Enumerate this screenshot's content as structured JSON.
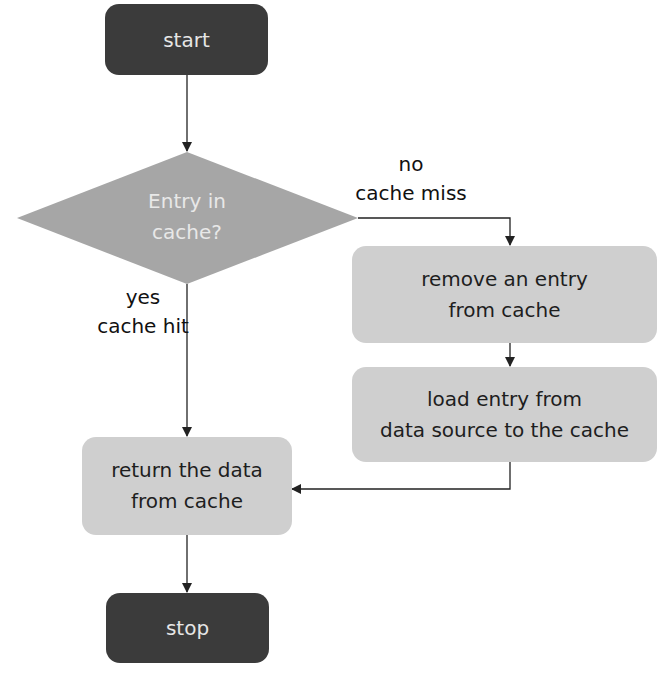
{
  "diagram": {
    "type": "flowchart",
    "nodes": {
      "start": {
        "label": "start",
        "shape": "terminal"
      },
      "decision": {
        "label": "Entry in\ncache?",
        "shape": "diamond"
      },
      "remove": {
        "label": "remove an entry\nfrom cache",
        "shape": "process"
      },
      "load": {
        "label": "load entry from\ndata source to the cache",
        "shape": "process"
      },
      "return": {
        "label": "return the data\nfrom cache",
        "shape": "process"
      },
      "stop": {
        "label": "stop",
        "shape": "terminal"
      }
    },
    "edge_labels": {
      "no_branch": "no\ncache miss",
      "yes_branch": "yes\ncache hit"
    },
    "edges": [
      {
        "from": "start",
        "to": "decision"
      },
      {
        "from": "decision",
        "to": "remove",
        "label": "no / cache miss"
      },
      {
        "from": "decision",
        "to": "return",
        "label": "yes / cache hit"
      },
      {
        "from": "remove",
        "to": "load"
      },
      {
        "from": "load",
        "to": "return"
      },
      {
        "from": "return",
        "to": "stop"
      }
    ],
    "colors": {
      "terminal_fill": "#3b3b3b",
      "terminal_text": "#e6e6e6",
      "decision_fill": "#a6a6a6",
      "process_fill": "#cfcfcf",
      "edge": "#222222"
    }
  }
}
